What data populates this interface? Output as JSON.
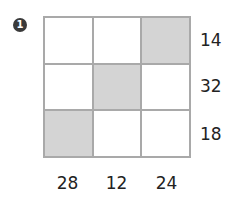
{
  "problem_number": "1",
  "grid": {
    "rows": 3,
    "cols": 3,
    "shaded": [
      [
        false,
        false,
        true
      ],
      [
        false,
        true,
        false
      ],
      [
        true,
        false,
        false
      ]
    ],
    "colors": {
      "shaded": "#d4d4d4",
      "empty": "#ffffff",
      "border": "#a9a9a9"
    }
  },
  "row_labels": [
    "14",
    "32",
    "18"
  ],
  "col_labels": [
    "28",
    "12",
    "24"
  ]
}
